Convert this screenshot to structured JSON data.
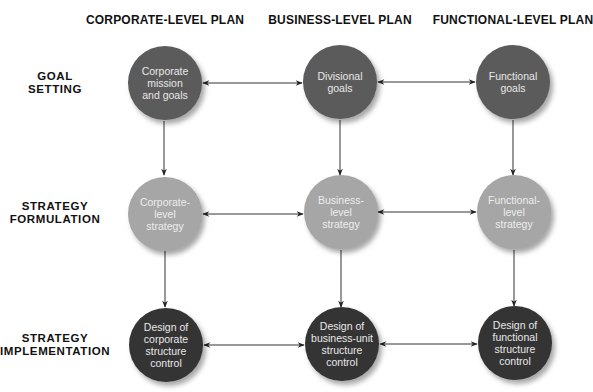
{
  "columns": [
    {
      "label": "CORPORATE-LEVEL PLAN",
      "x": 165
    },
    {
      "label": "BUSINESS-LEVEL PLAN",
      "x": 340
    },
    {
      "label": "FUNCTIONAL-LEVEL PLAN",
      "x": 513
    }
  ],
  "rows": [
    {
      "lines": [
        "GOAL",
        "SETTING"
      ],
      "y": 83
    },
    {
      "lines": [
        "STRATEGY",
        "FORMULATION"
      ],
      "y": 213
    },
    {
      "lines": [
        "STRATEGY",
        "IMPLEMENTATION"
      ],
      "y": 345
    }
  ],
  "nodes": [
    [
      {
        "lines": [
          "Corporate",
          "mission",
          "and goals"
        ],
        "level": "goal"
      },
      {
        "lines": [
          "Divisional",
          "goals"
        ],
        "level": "goal"
      },
      {
        "lines": [
          "Functional",
          "goals"
        ],
        "level": "goal"
      }
    ],
    [
      {
        "lines": [
          "Corporate-",
          "level",
          "strategy"
        ],
        "level": "formulation"
      },
      {
        "lines": [
          "Business-",
          "level",
          "strategy"
        ],
        "level": "formulation"
      },
      {
        "lines": [
          "Functional-",
          "level",
          "strategy"
        ],
        "level": "formulation"
      }
    ],
    [
      {
        "lines": [
          "Design of",
          "corporate",
          "structure",
          "control"
        ],
        "level": "implementation"
      },
      {
        "lines": [
          "Design of",
          "business-unit",
          "structure",
          "control"
        ],
        "level": "implementation"
      },
      {
        "lines": [
          "Design of",
          "functional",
          "structure",
          "control"
        ],
        "level": "implementation"
      }
    ]
  ],
  "colors": {
    "goal_fill": "#5b5b5b",
    "formulation_fill": "#a6a6a6",
    "implementation_fill": "#343434",
    "arrow": "#222222"
  },
  "connections": {
    "horizontal": "bidirectional",
    "vertical": "downward"
  }
}
